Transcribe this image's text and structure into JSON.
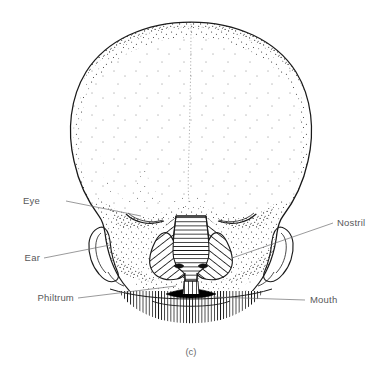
{
  "figure": {
    "caption": "(c)",
    "background_color": "#ffffff",
    "ink_color": "#1a1a1a",
    "label_color": "#58585a",
    "leader_color": "#6e6e70"
  },
  "labels": [
    {
      "id": "eye",
      "text": "Eye",
      "side": "left",
      "text_x": 40,
      "text_y": 204,
      "leader": {
        "x1": 66,
        "y1": 201,
        "x2": 141,
        "y2": 216
      }
    },
    {
      "id": "ear",
      "text": "Ear",
      "side": "left",
      "text_x": 22,
      "text_y": 261,
      "leader": {
        "x1": 44,
        "y1": 258,
        "x2": 110,
        "y2": 245
      }
    },
    {
      "id": "philtrum",
      "text": "Philtrum",
      "side": "left",
      "text_x": 32,
      "text_y": 301,
      "leader": {
        "x1": 78,
        "y1": 298,
        "x2": 176,
        "y2": 286
      }
    },
    {
      "id": "nostril",
      "text": "Nostril",
      "side": "right",
      "text_x": 337,
      "text_y": 226,
      "leader": {
        "x1": 333,
        "y1": 223,
        "x2": 232,
        "y2": 258
      }
    },
    {
      "id": "mouth",
      "text": "Mouth",
      "side": "right",
      "text_x": 310,
      "text_y": 303,
      "leader": {
        "x1": 305,
        "y1": 300,
        "x2": 213,
        "y2": 297
      }
    }
  ],
  "anatomy": {
    "cranium": {
      "name": "cranial vault",
      "shading": "stipple",
      "midline_suture": "sagittal suture (dotted)"
    },
    "nose": {
      "name": "external nose",
      "dorsum_hatch": "horizontal",
      "alae_hatch": "diagonal"
    },
    "philtrum": {
      "name": "philtrum",
      "hatch": "vertical"
    },
    "mouth": {
      "name": "oral fissure",
      "fill": "solid black"
    },
    "chin": {
      "name": "mandible / chin",
      "hatch": "vertical"
    },
    "ears": {
      "name": "auricle",
      "count": 2
    },
    "eyes": {
      "name": "closed eyelids",
      "count": 2
    }
  }
}
